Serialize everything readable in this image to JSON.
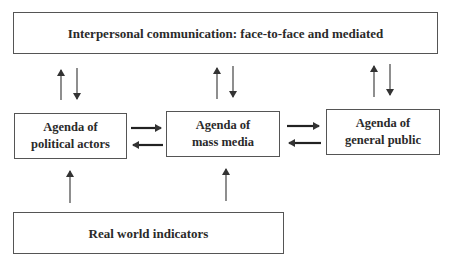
{
  "diagram": {
    "nodes": {
      "interpersonal": {
        "label": "Interpersonal communication: face-to-face and mediated"
      },
      "political": {
        "label": "Agenda of\npolitical actors"
      },
      "media": {
        "label": "Agenda of\nmass media"
      },
      "public": {
        "label": "Agenda of\ngeneral public"
      },
      "real_world": {
        "label": "Real world indicators"
      }
    },
    "edges": [
      {
        "from": "political",
        "to": "interpersonal"
      },
      {
        "from": "interpersonal",
        "to": "political"
      },
      {
        "from": "media",
        "to": "interpersonal"
      },
      {
        "from": "interpersonal",
        "to": "media"
      },
      {
        "from": "public",
        "to": "interpersonal"
      },
      {
        "from": "interpersonal",
        "to": "public"
      },
      {
        "from": "political",
        "to": "media"
      },
      {
        "from": "media",
        "to": "political"
      },
      {
        "from": "media",
        "to": "public"
      },
      {
        "from": "public",
        "to": "media"
      },
      {
        "from": "real_world",
        "to": "political"
      },
      {
        "from": "real_world",
        "to": "media"
      }
    ],
    "colors": {
      "stroke": "#333333",
      "border": "#555555",
      "text": "#2a2a2a"
    }
  }
}
